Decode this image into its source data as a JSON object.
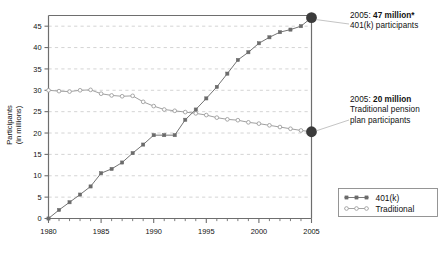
{
  "chart_data": {
    "type": "line",
    "title": "",
    "xlabel": "",
    "ylabel": "Participants (in millions)",
    "ylabel_line1": "Participants",
    "ylabel_line2": "(in millions)",
    "xlim": [
      1980,
      2005
    ],
    "ylim": [
      0,
      47.5
    ],
    "grid": true,
    "grid_style": "dashed-horizontal",
    "legend_position": "bottom-right",
    "x_ticks": [
      1980,
      1985,
      1990,
      1995,
      2000,
      2005
    ],
    "x_tick_labels": [
      "1980",
      "1985",
      "1990",
      "1995",
      "2000",
      "2005"
    ],
    "x_minor_ticks": [
      1981,
      1982,
      1983,
      1984,
      1986,
      1987,
      1988,
      1989,
      1991,
      1992,
      1993,
      1994,
      1996,
      1997,
      1998,
      1999,
      2001,
      2002,
      2003,
      2004
    ],
    "y_ticks": [
      0,
      5,
      10,
      15,
      20,
      25,
      30,
      35,
      40,
      45
    ],
    "y_tick_labels": [
      "0",
      "5",
      "10",
      "15",
      "20",
      "25",
      "30",
      "35",
      "40",
      "45"
    ],
    "x": [
      1980,
      1981,
      1982,
      1983,
      1984,
      1985,
      1986,
      1987,
      1988,
      1989,
      1990,
      1991,
      1992,
      1993,
      1994,
      1995,
      1996,
      1997,
      1998,
      1999,
      2000,
      2001,
      2002,
      2003,
      2004,
      2005
    ],
    "series": [
      {
        "name": "401(k)",
        "marker": "filled-square",
        "color": "#6b6b6b",
        "values": [
          0.0,
          2.0,
          3.8,
          5.6,
          7.5,
          10.6,
          11.6,
          13.1,
          15.3,
          17.3,
          19.5,
          19.5,
          19.5,
          23.1,
          25.5,
          28.1,
          30.8,
          33.9,
          37.1,
          38.9,
          41.0,
          42.4,
          43.6,
          44.2,
          45.0,
          47.0
        ]
      },
      {
        "name": "Traditional",
        "marker": "open-circle",
        "color": "#9a9a9a",
        "values": [
          30.0,
          29.8,
          29.7,
          30.0,
          30.1,
          29.2,
          28.8,
          28.6,
          28.7,
          27.3,
          26.3,
          25.5,
          25.2,
          24.9,
          24.6,
          24.2,
          23.6,
          23.2,
          23.0,
          22.5,
          22.2,
          21.8,
          21.4,
          21.0,
          20.6,
          20.3
        ]
      }
    ],
    "highlight_points": [
      {
        "series": "401(k)",
        "x": 2005,
        "y": 47.0,
        "style": "large-filled-dot",
        "color": "#3b3b3b"
      },
      {
        "series": "Traditional",
        "x": 2005,
        "y": 20.3,
        "style": "large-filled-dot",
        "color": "#3b3b3b"
      }
    ],
    "annotations": [
      {
        "id": "anno-401k",
        "prefix": "2005: ",
        "bold": "47 million*",
        "line2": "401(k) participants",
        "target_series": "401(k)",
        "target_x": 2005,
        "target_y": 47.0
      },
      {
        "id": "anno-trad",
        "prefix": "2005: ",
        "bold": "20 million",
        "line2": "Traditional pension",
        "line3": "plan participants",
        "target_series": "Traditional",
        "target_x": 2005,
        "target_y": 20.3
      }
    ],
    "legend": {
      "entries": [
        {
          "label": "401(k)",
          "marker": "filled-square"
        },
        {
          "label": "Traditional",
          "marker": "open-circle"
        }
      ]
    },
    "colors": {
      "axis": "#6e6e6e",
      "grid": "#c9c9c9",
      "series_401k": "#6b6b6b",
      "series_traditional": "#9a9a9a",
      "highlight_dot": "#3b3b3b",
      "text": "#111111",
      "legend_border": "#8a8a8a",
      "background": "#ffffff"
    }
  }
}
